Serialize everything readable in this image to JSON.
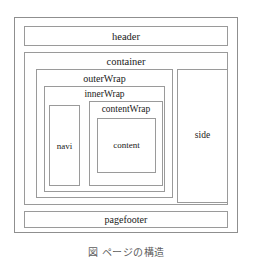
{
  "diagram": {
    "type": "nested-box-layout-wireframe",
    "line_color": "#9a9a9a",
    "text_color": "#1a1a1a",
    "background": "#ffffff",
    "boxes": {
      "frame": {
        "label": ""
      },
      "header": {
        "label": "header"
      },
      "container": {
        "label": "container"
      },
      "outerWrap": {
        "label": "outerWrap"
      },
      "innerWrap": {
        "label": "innerWrap"
      },
      "navi": {
        "label": "navi"
      },
      "contentWrap": {
        "label": "contentWrap"
      },
      "content": {
        "label": "content"
      },
      "side": {
        "label": "side"
      },
      "pagefooter": {
        "label": "pagefooter"
      }
    }
  },
  "caption": {
    "text": "図  ページの構造"
  }
}
